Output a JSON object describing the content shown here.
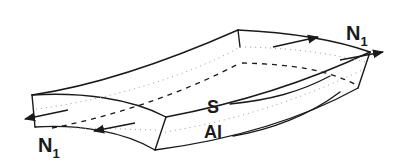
{
  "diagram": {
    "labels": {
      "force_left_main": "N",
      "force_left_sub": "1",
      "force_right_main": "N",
      "force_right_sub": "1",
      "surface_label": "S",
      "axial_label": "Al"
    },
    "colors": {
      "line": "#1a1a1a",
      "dotted": "#9a9a9a",
      "background": "#ffffff"
    }
  }
}
